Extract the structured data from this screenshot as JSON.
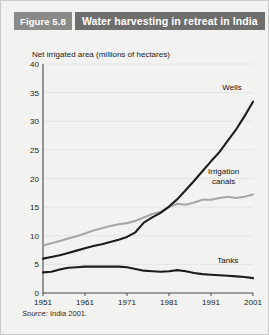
{
  "figure": {
    "number_label": "Figure 5.8",
    "title": "Water harvesting in retreat in India",
    "tag_bg": "#8a8a88",
    "title_bg": "#6e6e6c",
    "panel_bg": "#f2f2f0"
  },
  "source": {
    "prefix": "Source:",
    "text": " India 2001."
  },
  "chart_data": {
    "type": "line",
    "title": "Water harvesting in retreat in India",
    "subtitle": "",
    "xlabel": "",
    "ylabel": "Net irrigated area (millions of hectares)",
    "axis_caption": "Net irrigated area (millions of hectares)",
    "xlim": [
      1951,
      2001
    ],
    "ylim": [
      0,
      40
    ],
    "yticks": [
      0,
      5,
      10,
      15,
      20,
      25,
      30,
      35,
      40
    ],
    "ytick_labels": [
      "0",
      "5",
      "10",
      "15",
      "20",
      "25",
      "30",
      "35",
      "40"
    ],
    "xticks": [
      1951,
      1961,
      1971,
      1981,
      1991,
      2001
    ],
    "xtick_labels": [
      "1951",
      "1961",
      "1971",
      "1981",
      "1991",
      "2001"
    ],
    "grid": true,
    "grid_axis": "y",
    "legend_position": "inline-annotations",
    "colors": {
      "wells": "#1c1c1c",
      "canals": "#a6a6a4",
      "tanks": "#1c1c1c"
    },
    "annotations": [
      {
        "name": "wells-label",
        "text": "Wells",
        "x": 1996,
        "y": 35.5
      },
      {
        "name": "canals-label-line1",
        "text": "Irrigation",
        "x": 1994,
        "y": 20.8
      },
      {
        "name": "canals-label-line2",
        "text": "canals",
        "x": 1994,
        "y": 19.0
      },
      {
        "name": "tanks-label",
        "text": "Tanks",
        "x": 1995,
        "y": 5.3
      }
    ],
    "x": [
      1951,
      1953,
      1955,
      1957,
      1959,
      1961,
      1963,
      1965,
      1967,
      1969,
      1971,
      1973,
      1975,
      1977,
      1979,
      1981,
      1983,
      1985,
      1987,
      1989,
      1991,
      1993,
      1995,
      1997,
      1999,
      2001
    ],
    "series": [
      {
        "name": "Wells",
        "color": "#1c1c1c",
        "values": [
          6.0,
          6.3,
          6.6,
          7.0,
          7.4,
          7.8,
          8.2,
          8.5,
          8.9,
          9.3,
          9.8,
          10.6,
          12.3,
          13.2,
          14.0,
          15.1,
          16.4,
          18.0,
          19.6,
          21.3,
          23.0,
          24.6,
          26.6,
          28.6,
          30.9,
          33.4
        ]
      },
      {
        "name": "Irrigation canals",
        "color": "#a6a6a4",
        "values": [
          8.3,
          8.7,
          9.1,
          9.5,
          9.9,
          10.4,
          10.9,
          11.3,
          11.7,
          12.0,
          12.2,
          12.6,
          13.2,
          13.8,
          14.2,
          15.0,
          15.6,
          15.4,
          15.8,
          16.3,
          16.3,
          16.6,
          16.8,
          16.6,
          16.8,
          17.2
        ]
      },
      {
        "name": "Tanks",
        "color": "#1c1c1c",
        "values": [
          3.6,
          3.7,
          4.1,
          4.4,
          4.5,
          4.6,
          4.6,
          4.6,
          4.6,
          4.6,
          4.5,
          4.2,
          3.9,
          3.8,
          3.7,
          3.8,
          4.0,
          3.8,
          3.5,
          3.3,
          3.2,
          3.1,
          3.0,
          2.9,
          2.8,
          2.6
        ]
      }
    ]
  }
}
